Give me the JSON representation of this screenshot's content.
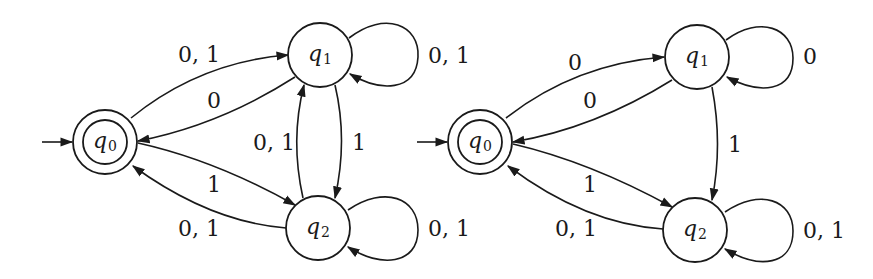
{
  "diagrams": [
    {
      "name": "automaton-left",
      "start_state": "q0",
      "accepting_states": [
        "q0"
      ],
      "states": [
        {
          "id": "q0",
          "base": "q",
          "sub": "0",
          "accepting": true,
          "start": true
        },
        {
          "id": "q1",
          "base": "q",
          "sub": "1",
          "accepting": false,
          "start": false
        },
        {
          "id": "q2",
          "base": "q",
          "sub": "2",
          "accepting": false,
          "start": false
        }
      ],
      "transitions": [
        {
          "from": "q0",
          "to": "q1",
          "label": "0, 1"
        },
        {
          "from": "q1",
          "to": "q0",
          "label": "0"
        },
        {
          "from": "q1",
          "to": "q1",
          "label": "0, 1"
        },
        {
          "from": "q2",
          "to": "q1",
          "label": "0, 1"
        },
        {
          "from": "q1",
          "to": "q2",
          "label": "1"
        },
        {
          "from": "q0",
          "to": "q2",
          "label": "1"
        },
        {
          "from": "q2",
          "to": "q0",
          "label": "0, 1"
        },
        {
          "from": "q2",
          "to": "q2",
          "label": "0, 1"
        }
      ]
    },
    {
      "name": "automaton-right",
      "start_state": "q0",
      "accepting_states": [
        "q0"
      ],
      "states": [
        {
          "id": "q0",
          "base": "q",
          "sub": "0",
          "accepting": true,
          "start": true
        },
        {
          "id": "q1",
          "base": "q",
          "sub": "1",
          "accepting": false,
          "start": false
        },
        {
          "id": "q2",
          "base": "q",
          "sub": "2",
          "accepting": false,
          "start": false
        }
      ],
      "transitions": [
        {
          "from": "q0",
          "to": "q1",
          "label": "0"
        },
        {
          "from": "q1",
          "to": "q0",
          "label": "0"
        },
        {
          "from": "q1",
          "to": "q1",
          "label": "0"
        },
        {
          "from": "q1",
          "to": "q2",
          "label": "1"
        },
        {
          "from": "q0",
          "to": "q2",
          "label": "1"
        },
        {
          "from": "q2",
          "to": "q0",
          "label": "0, 1"
        },
        {
          "from": "q2",
          "to": "q2",
          "label": "0, 1"
        }
      ]
    }
  ]
}
